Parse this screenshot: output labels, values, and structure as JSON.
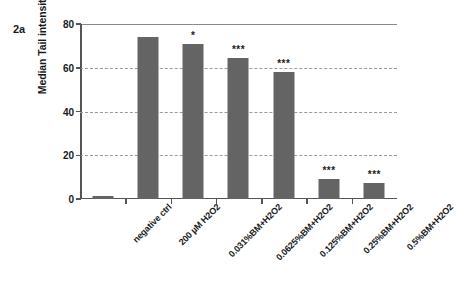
{
  "figure": {
    "panel_label": "2a"
  },
  "chart_data": {
    "type": "bar",
    "title": "",
    "xlabel": "",
    "ylabel": "Median Tail intensity",
    "ylim": [
      0,
      80
    ],
    "yticks": [
      0,
      20,
      40,
      60,
      80
    ],
    "ytick_labels": [
      "0",
      "20",
      "40",
      "60",
      "80"
    ],
    "grid": true,
    "grid_axis": "y",
    "grid_style": "dashed",
    "legend": false,
    "bar_color": "#646464",
    "categories": [
      "negative ctrl",
      "200 µM H2O2",
      "0.031%BM+H2O2",
      "0.0625%BM+H2O2",
      "0.125%BM+H2O2",
      "0.25%BM+H2O2",
      "0.5%BM+H2O2"
    ],
    "values": [
      1.5,
      74,
      71,
      64.5,
      58,
      9,
      7.5
    ],
    "annotations": [
      "",
      "",
      "*",
      "***",
      "***",
      "***",
      "***"
    ],
    "annotation_meaning": "significance markers"
  }
}
